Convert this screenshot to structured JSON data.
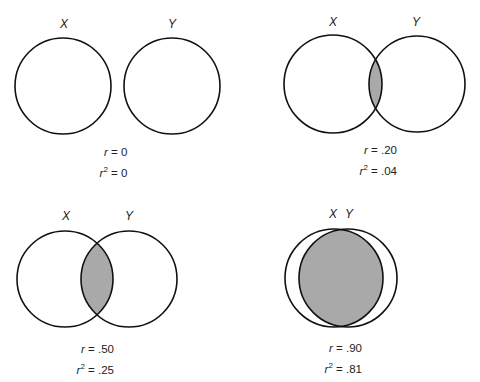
{
  "panels": [
    {
      "x_label": "X",
      "y_label": "Y",
      "r": "r = 0",
      "r_var": "r",
      "r_val": "= 0",
      "r2_val": "= 0",
      "overlap": "none"
    },
    {
      "x_label": "X",
      "y_label": "Y",
      "r": "r = .20",
      "r_var": "r",
      "r_val": "= .20",
      "r2_val": "= .04",
      "overlap": "small"
    },
    {
      "x_label": "X",
      "y_label": "Y",
      "r": "r = .50",
      "r_var": "r",
      "r_val": "= .50",
      "r2_val": "= .25",
      "overlap": "medium"
    },
    {
      "x_label": "X",
      "y_label": "Y",
      "r": "r = .90",
      "r_var": "r",
      "r_val": "= .90",
      "r2_val": "= .81",
      "overlap": "large"
    }
  ],
  "superscript": "2",
  "colors": {
    "stroke": "#111111",
    "shade": "#a9a9a9"
  }
}
